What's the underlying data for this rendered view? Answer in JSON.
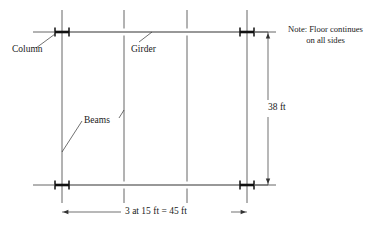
{
  "figure": {
    "type": "structural-framing-plan",
    "background_color": "#ffffff",
    "line_color": "#333333",
    "member_color": "#111111",
    "text_color": "#1a1a1a"
  },
  "labels": {
    "column": "Column",
    "girder": "Girder",
    "beams": "Beams",
    "vertical_dimension": "38 ft",
    "horizontal_dimension": "3 at 15 ft = 45 ft"
  },
  "note": {
    "line1": "Note: Floor continues",
    "line2": "on all sides"
  },
  "geometry": {
    "bays": 3,
    "bay_spacing_ft": 15,
    "total_width_ft": 45,
    "total_depth_ft": 38,
    "column_x_px": [
      62,
      247
    ],
    "beam_x_px": [
      62,
      124,
      187,
      247
    ],
    "girder_y_px": [
      32,
      185
    ],
    "vertical_overhang_top_px": 22,
    "vertical_overhang_bottom_px": 18,
    "girder_stub_px": 22
  }
}
